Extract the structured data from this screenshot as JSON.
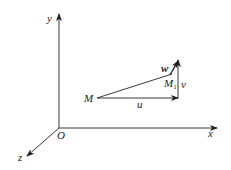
{
  "diagram": {
    "axes": {
      "x": "x",
      "y": "y",
      "z": "z",
      "origin": "O"
    },
    "points": {
      "M": "M",
      "M1_base": "M",
      "M1_sub": "1"
    },
    "vectors": {
      "u": "u",
      "v": "v",
      "w": "w"
    },
    "colors": {
      "line": "#222222",
      "background": "#ffffff"
    }
  }
}
